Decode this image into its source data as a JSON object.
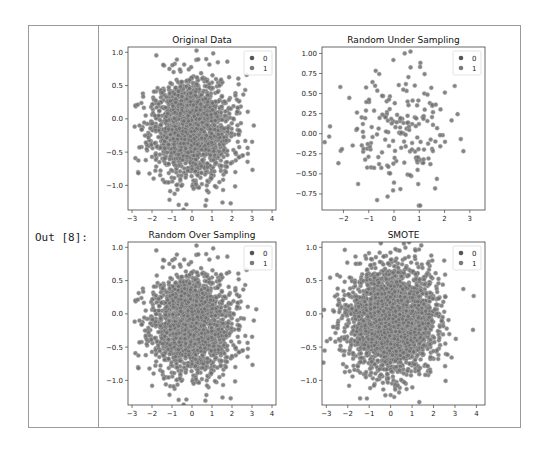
{
  "cell": {
    "prompt": "Out [8]:"
  },
  "colors": {
    "point_fill": "#6f6f6f",
    "point_edge": "#b0b0b0",
    "legend_0": "#555555",
    "legend_1": "#7a7a7a",
    "axes": "#444444"
  },
  "chart_data": [
    {
      "type": "scatter",
      "title": "Original Data",
      "xlabel": "",
      "ylabel": "",
      "xticks": [
        -3,
        -2,
        -1,
        0,
        1,
        2,
        3,
        4
      ],
      "yticks": [
        1.0,
        0.5,
        0.0,
        -0.5,
        -1.0
      ],
      "ytick_labels": [
        "1.0",
        "0.5",
        "0.0",
        "−0.5",
        "−1.0"
      ],
      "xlim": [
        -3.2,
        4.2
      ],
      "ylim": [
        -1.37,
        1.08
      ],
      "legend": [
        "0",
        "1"
      ],
      "legend_position": "upper right",
      "n_points": 1800,
      "distribution": {
        "x_mean": 0.0,
        "x_std": 1.0,
        "y_mean": -0.15,
        "y_std": 0.38,
        "seed": 11
      }
    },
    {
      "type": "scatter",
      "title": "Random Under Sampling",
      "xlabel": "",
      "ylabel": "",
      "xticks": [
        -2,
        -1,
        0,
        1,
        2,
        3
      ],
      "yticks": [
        1.0,
        0.75,
        0.5,
        0.25,
        0.0,
        -0.25,
        -0.5,
        -0.75
      ],
      "ytick_labels": [
        "1.00",
        "0.75",
        "0.50",
        "0.25",
        "0.00",
        "−0.25",
        "−0.50",
        "−0.75"
      ],
      "xlim": [
        -2.85,
        3.6
      ],
      "ylim": [
        -0.95,
        1.08
      ],
      "legend": [
        "0",
        "1"
      ],
      "legend_position": "upper right",
      "n_points": 200,
      "distribution": {
        "x_mean": 0.1,
        "x_std": 1.05,
        "y_mean": 0.0,
        "y_std": 0.4,
        "seed": 23
      }
    },
    {
      "type": "scatter",
      "title": "Random Over Sampling",
      "xlabel": "",
      "ylabel": "",
      "xticks": [
        -3,
        -2,
        -1,
        0,
        1,
        2,
        3,
        4
      ],
      "yticks": [
        1.0,
        0.5,
        0.0,
        -0.5,
        -1.0
      ],
      "ytick_labels": [
        "1.0",
        "0.5",
        "0.0",
        "−0.5",
        "−1.0"
      ],
      "xlim": [
        -3.2,
        4.2
      ],
      "ylim": [
        -1.37,
        1.08
      ],
      "legend": [
        "0",
        "1"
      ],
      "legend_position": "upper right",
      "n_points": 2000,
      "distribution": {
        "x_mean": 0.0,
        "x_std": 1.0,
        "y_mean": -0.15,
        "y_std": 0.38,
        "seed": 11
      }
    },
    {
      "type": "scatter",
      "title": "SMOTE",
      "xlabel": "",
      "ylabel": "",
      "xticks": [
        -3,
        -2,
        -1,
        0,
        1,
        2,
        3,
        4
      ],
      "yticks": [
        1.0,
        0.5,
        0.0,
        -0.5,
        -1.0
      ],
      "ytick_labels": [
        "1.0",
        "0.5",
        "0.0",
        "−0.5",
        "−1.0"
      ],
      "xlim": [
        -3.2,
        4.4
      ],
      "ylim": [
        -1.37,
        1.08
      ],
      "legend": [
        "0",
        "1"
      ],
      "legend_position": "upper right",
      "n_points": 2600,
      "distribution": {
        "x_mean": 0.0,
        "x_std": 1.0,
        "y_mean": -0.1,
        "y_std": 0.4,
        "seed": 37
      }
    }
  ],
  "axes_boxes": [
    {
      "x": 128,
      "y": 47,
      "w": 148,
      "h": 163
    },
    {
      "x": 322,
      "y": 47,
      "w": 163,
      "h": 163
    },
    {
      "x": 128,
      "y": 242,
      "w": 148,
      "h": 163
    },
    {
      "x": 322,
      "y": 242,
      "w": 163,
      "h": 163
    }
  ]
}
